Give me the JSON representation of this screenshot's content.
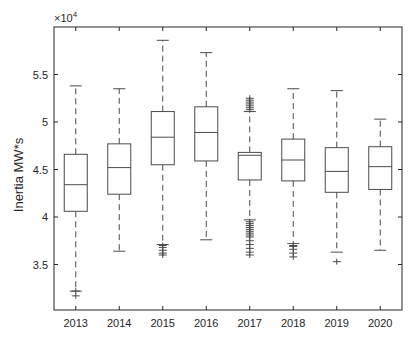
{
  "chart_data": {
    "type": "boxplot",
    "title": "",
    "xlabel": "",
    "ylabel": "Inertia MW*s",
    "y_exponent_label": "×10",
    "y_exponent_power": "4",
    "ylim": [
      3.02,
      6.0
    ],
    "yticks": [
      3.5,
      4,
      4.5,
      5,
      5.5
    ],
    "ytick_labels": [
      "3.5",
      "4",
      "4.5",
      "5",
      "5.5"
    ],
    "grid": false,
    "legend": null,
    "categories": [
      "2013",
      "2014",
      "2015",
      "2016",
      "2017",
      "2018",
      "2019",
      "2020"
    ],
    "series": [
      {
        "name": "2013",
        "whisker_low": 3.22,
        "q1": 4.06,
        "median": 4.34,
        "q3": 4.66,
        "whisker_high": 5.38,
        "outliers": [
          3.22,
          3.17
        ]
      },
      {
        "name": "2014",
        "whisker_low": 3.64,
        "q1": 4.24,
        "median": 4.52,
        "q3": 4.77,
        "whisker_high": 5.35,
        "outliers": []
      },
      {
        "name": "2015",
        "whisker_low": 3.71,
        "q1": 4.55,
        "median": 4.84,
        "q3": 5.11,
        "whisker_high": 5.86,
        "outliers": [
          3.7,
          3.68,
          3.65,
          3.62,
          3.6
        ]
      },
      {
        "name": "2016",
        "whisker_low": 3.76,
        "q1": 4.59,
        "median": 4.89,
        "q3": 5.16,
        "whisker_high": 5.73,
        "outliers": []
      },
      {
        "name": "2017",
        "whisker_low": 3.97,
        "q1": 4.39,
        "median": 4.65,
        "q3": 4.68,
        "whisker_high": 5.11,
        "outliers": [
          5.13,
          5.15,
          5.17,
          5.19,
          5.21,
          5.23,
          5.25,
          3.95,
          3.93,
          3.91,
          3.89,
          3.87,
          3.85,
          3.83,
          3.81,
          3.79,
          3.75,
          3.71,
          3.67,
          3.63,
          3.6
        ]
      },
      {
        "name": "2018",
        "whisker_low": 3.72,
        "q1": 4.38,
        "median": 4.6,
        "q3": 4.82,
        "whisker_high": 5.35,
        "outliers": [
          3.7,
          3.69,
          3.66,
          3.62,
          3.58
        ]
      },
      {
        "name": "2019",
        "whisker_low": 3.63,
        "q1": 4.26,
        "median": 4.48,
        "q3": 4.73,
        "whisker_high": 5.33,
        "outliers": [
          3.53
        ]
      },
      {
        "name": "2020",
        "whisker_low": 3.65,
        "q1": 4.29,
        "median": 4.53,
        "q3": 4.74,
        "whisker_high": 5.03,
        "outliers": []
      }
    ]
  },
  "colors": {
    "box": "#4a4a4a",
    "whisker": "#4a4a4a",
    "outlier": "#4a4a4a",
    "axis": "#262626"
  }
}
